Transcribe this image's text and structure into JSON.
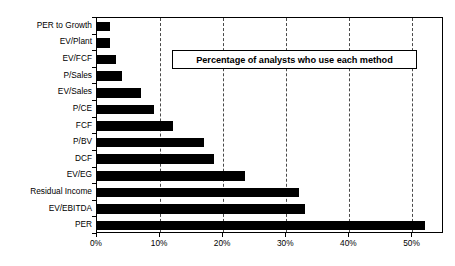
{
  "chart_data": {
    "type": "bar",
    "orientation": "horizontal",
    "title": "Percentage of analysts who use each method",
    "xlabel": "",
    "ylabel": "",
    "xlim": [
      0,
      55
    ],
    "xticks": [
      "0%",
      "10%",
      "20%",
      "30%",
      "40%",
      "50%"
    ],
    "xtick_values": [
      0,
      10,
      20,
      30,
      40,
      50
    ],
    "grid": true,
    "grid_axis": "x",
    "grid_style": "dashed",
    "legend": "none",
    "bar_color": "#000000",
    "categories": [
      "PER to Growth",
      "EV/Plant",
      "EV/FCF",
      "P/Sales",
      "EV/Sales",
      "P/CE",
      "FCF",
      "P/BV",
      "DCF",
      "EV/EG",
      "Residual Income",
      "EV/EBITDA",
      "PER"
    ],
    "values": [
      2,
      2,
      3,
      4,
      7,
      9,
      12,
      17,
      18.5,
      23.5,
      32,
      33,
      52
    ]
  }
}
